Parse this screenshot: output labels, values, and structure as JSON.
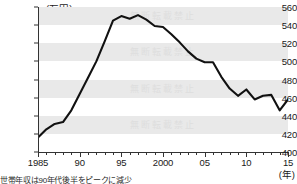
{
  "chart_data": {
    "type": "line",
    "title": "",
    "unit_label": "(万円)",
    "xlabel": "(年)",
    "ylabel": "",
    "ylim": [
      400,
      560
    ],
    "xlim": [
      1985,
      2015
    ],
    "ytick_step": 20,
    "yticks": [
      400,
      420,
      440,
      460,
      480,
      500,
      520,
      540,
      560
    ],
    "xticks_major": [
      1985,
      1990,
      1995,
      2000,
      2005,
      2010,
      2015
    ],
    "xtick_labels": [
      "1985",
      "90",
      "95",
      "2000",
      "05",
      "10",
      "15"
    ],
    "grid": "horizontal-bands",
    "legend": "none",
    "line_color": "#111111",
    "band_color": "#e9e9e9",
    "x": [
      1985,
      1986,
      1987,
      1988,
      1989,
      1990,
      1991,
      1992,
      1993,
      1994,
      1995,
      1996,
      1997,
      1998,
      1999,
      2000,
      2001,
      2002,
      2003,
      2004,
      2005,
      2006,
      2007,
      2008,
      2009,
      2010,
      2011,
      2012,
      2013,
      2014,
      2015
    ],
    "values": [
      416,
      425,
      431,
      433,
      446,
      464,
      482,
      500,
      522,
      545,
      550,
      547,
      551,
      546,
      539,
      538,
      530,
      521,
      511,
      503,
      499,
      499,
      483,
      470,
      462,
      469,
      458,
      462,
      463,
      446,
      458
    ],
    "annotations": [
      {
        "label": "peak",
        "x": 1997,
        "y": 551
      },
      {
        "label": "start",
        "x": 1985,
        "y": 416
      },
      {
        "label": "end",
        "x": 2015,
        "y": 458
      }
    ],
    "watermark_text": "無断転載禁止"
  },
  "caption": {
    "note": "世帯年収は90年代後半をピークに減少"
  }
}
